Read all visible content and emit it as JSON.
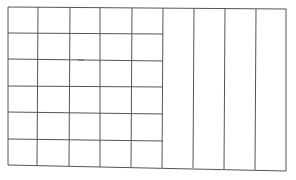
{
  "drawing": {
    "description": "Hand-drawn grid: left 5 columns subdivided into 6 rows, right 4 columns undivided",
    "stroke_color": "#555555",
    "background": "#ffffff",
    "left_section": {
      "columns": 5,
      "rows": 6
    },
    "right_section": {
      "columns": 4,
      "rows": 1
    },
    "total_columns": 9,
    "stray_mark": {
      "x": 80,
      "y": 61
    }
  }
}
